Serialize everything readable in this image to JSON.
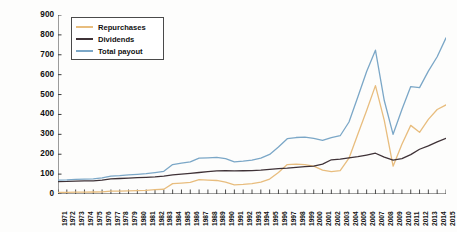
{
  "chart_data": {
    "type": "line",
    "title": "",
    "xlabel": "",
    "ylabel": "Billions of real 2012 USD",
    "ylim": [
      0,
      900
    ],
    "yticks": [
      0,
      100,
      200,
      300,
      400,
      500,
      600,
      700,
      800,
      900
    ],
    "grid": false,
    "legend_position": "top-left",
    "categories": [
      "1971",
      "1972",
      "1973",
      "1974",
      "1975",
      "1976",
      "1977",
      "1978",
      "1979",
      "1980",
      "1981",
      "1982",
      "1983",
      "1984",
      "1985",
      "1986",
      "1987",
      "1988",
      "1989",
      "1990",
      "1991",
      "1992",
      "1993",
      "1994",
      "1995",
      "1996",
      "1997",
      "1998",
      "1999",
      "2000",
      "2001",
      "2002",
      "2003",
      "2004",
      "2005",
      "2006",
      "2007",
      "2008",
      "2009",
      "2010",
      "2011",
      "2012",
      "2013",
      "2014",
      "2015"
    ],
    "series": [
      {
        "name": "Repurchases",
        "color": "#e8bd7e",
        "values": [
          8,
          8,
          9,
          9,
          10,
          11,
          14,
          14,
          16,
          17,
          18,
          22,
          24,
          52,
          55,
          58,
          72,
          70,
          68,
          60,
          46,
          48,
          52,
          60,
          75,
          108,
          148,
          150,
          148,
          140,
          120,
          112,
          118,
          180,
          300,
          420,
          545,
          370,
          140,
          250,
          345,
          310,
          375,
          425,
          448
        ]
      },
      {
        "name": "Dividends",
        "color": "#3f3237",
        "values": [
          62,
          63,
          65,
          66,
          66,
          70,
          76,
          78,
          80,
          82,
          84,
          86,
          90,
          96,
          100,
          104,
          108,
          112,
          116,
          118,
          116,
          117,
          118,
          120,
          124,
          128,
          130,
          134,
          138,
          140,
          150,
          172,
          175,
          182,
          188,
          196,
          205,
          185,
          170,
          178,
          198,
          225,
          242,
          262,
          280
        ]
      },
      {
        "name": "Total payout",
        "color": "#7ba7c7",
        "values": [
          70,
          71,
          74,
          75,
          76,
          81,
          90,
          92,
          96,
          99,
          102,
          108,
          114,
          148,
          155,
          162,
          180,
          182,
          184,
          178,
          162,
          165,
          170,
          180,
          199,
          236,
          278,
          284,
          286,
          280,
          270,
          284,
          293,
          362,
          488,
          616,
          723,
          470,
          300,
          425,
          540,
          535,
          618,
          690,
          785
        ]
      }
    ]
  },
  "legend": {
    "items": [
      {
        "label": "Repurchases"
      },
      {
        "label": "Dividends"
      },
      {
        "label": "Total payout"
      }
    ]
  },
  "axes": {
    "y_title": "Billions of real 2012 USD"
  }
}
